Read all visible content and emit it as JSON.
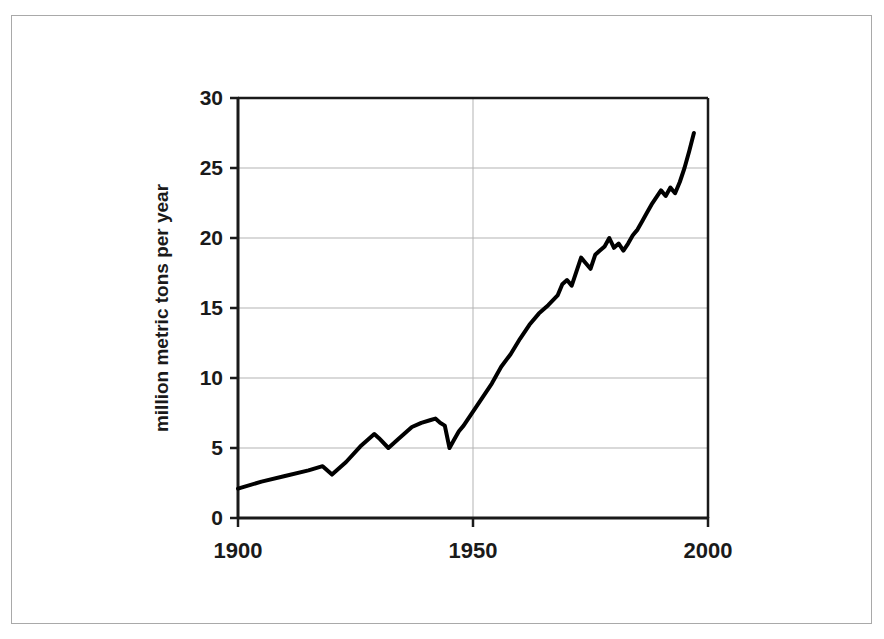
{
  "figure": {
    "border_color": "#a9a9a9",
    "background": "#ffffff"
  },
  "chart_data": {
    "type": "line",
    "title": "",
    "subtitle": "",
    "xlabel": "",
    "ylabel": "million metric tons per year",
    "xlim": [
      1900,
      2000
    ],
    "ylim": [
      0,
      30
    ],
    "xticks": [
      1900,
      1950,
      2000
    ],
    "xtick_labels": [
      "1900",
      "1950",
      "2000"
    ],
    "yticks": [
      0,
      5,
      10,
      15,
      20,
      25,
      30
    ],
    "ytick_labels": [
      "0",
      "5",
      "10",
      "15",
      "20",
      "25",
      "30"
    ],
    "grid": "horizontal-and-vertical-major",
    "grid_color": "#b3b3b3",
    "legend": "none",
    "line_color": "#000000",
    "line_width": 4,
    "annotations": [],
    "series": [
      {
        "name": "million metric tons per year",
        "x": [
          1900,
          1905,
          1910,
          1915,
          1918,
          1920,
          1923,
          1926,
          1929,
          1930,
          1932,
          1934,
          1937,
          1939,
          1941,
          1942,
          1943,
          1944,
          1945,
          1946,
          1947,
          1948,
          1950,
          1952,
          1954,
          1956,
          1958,
          1960,
          1962,
          1964,
          1966,
          1968,
          1969,
          1970,
          1971,
          1972,
          1973,
          1974,
          1975,
          1976,
          1977,
          1978,
          1979,
          1980,
          1981,
          1982,
          1983,
          1984,
          1985,
          1986,
          1987,
          1988,
          1989,
          1990,
          1991,
          1992,
          1993,
          1994,
          1995,
          1996,
          1997
        ],
        "values": [
          2.1,
          2.6,
          3.0,
          3.4,
          3.7,
          3.1,
          4.0,
          5.1,
          6.0,
          5.7,
          5.0,
          5.6,
          6.5,
          6.8,
          7.0,
          7.1,
          6.8,
          6.6,
          5.0,
          5.6,
          6.2,
          6.6,
          7.6,
          8.6,
          9.6,
          10.8,
          11.7,
          12.8,
          13.8,
          14.6,
          15.2,
          15.9,
          16.7,
          17.0,
          16.6,
          17.6,
          18.6,
          18.2,
          17.8,
          18.8,
          19.1,
          19.4,
          20.0,
          19.3,
          19.6,
          19.1,
          19.6,
          20.2,
          20.6,
          21.2,
          21.8,
          22.4,
          22.9,
          23.4,
          23.0,
          23.6,
          23.2,
          24.0,
          25.0,
          26.2,
          27.5
        ]
      }
    ]
  }
}
